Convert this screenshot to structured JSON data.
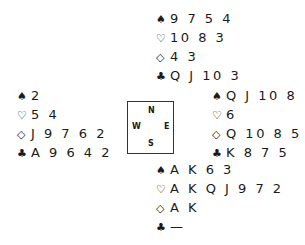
{
  "suit_symbols": {
    "spades": "♠",
    "hearts": "♡",
    "diamonds": "◇",
    "clubs": "♣"
  },
  "compass": {
    "north": "N",
    "south": "S",
    "west": "W",
    "east": "E"
  },
  "hands": {
    "north": {
      "spades": "9 7 5 4",
      "hearts": "10 8 3",
      "diamonds": "4 3",
      "clubs": "Q J 10 3"
    },
    "west": {
      "spades": "2",
      "hearts": "5 4",
      "diamonds": "J 9 7 6 2",
      "clubs": "A 9 6 4 2"
    },
    "east": {
      "spades": "Q J 10 8",
      "hearts": "6",
      "diamonds": "Q 10 8 5",
      "clubs": "K 8 7 5"
    },
    "south": {
      "spades": "A K 6 3",
      "hearts": "A K Q J 9 7 2",
      "diamonds": "A K",
      "clubs": "—"
    }
  }
}
